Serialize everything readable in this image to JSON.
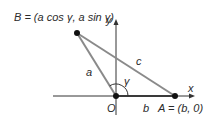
{
  "diagram": {
    "points": {
      "B": {
        "label": "B = (a cos γ, a sin γ)"
      },
      "O": {
        "label": "O"
      },
      "A": {
        "label": "A = (b, 0)"
      }
    },
    "sides": {
      "a": "a",
      "b": "b",
      "c": "c"
    },
    "angle": "γ",
    "axes": {
      "x": "x",
      "y": "y"
    },
    "colors": {
      "triangle": "#8a8a8a",
      "axis": "#333333",
      "point": "#111111",
      "base": "#3a3a3a"
    }
  }
}
